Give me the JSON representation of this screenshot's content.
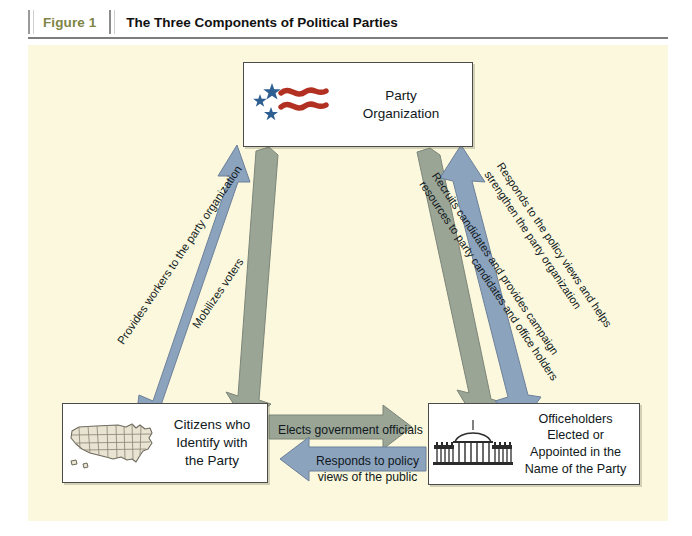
{
  "caption": {
    "figure_label": "Figure 1",
    "title": "The Three Components of Political Parties"
  },
  "colors": {
    "page_background": "#ffffff",
    "panel_background": "#fbf8dd",
    "arrow_blue": "#8ca3be",
    "arrow_gray_green": "#9aa596",
    "figure_label_color": "#7e8545",
    "flag_star_blue": "#2e5f92",
    "flag_stripe_red": "#b23022",
    "map_fill": "#e9e3d2",
    "whitehouse_dark": "#2b2b2b"
  },
  "nodes": [
    {
      "id": "party-organization",
      "label": "Party\nOrganization",
      "icon": "us-flag-stars-stripes-icon"
    },
    {
      "id": "citizens",
      "label": "Citizens who\nIdentify with\nthe Party",
      "icon": "united-states-map-icon"
    },
    {
      "id": "officeholders",
      "label": "Officeholders\nElected or\nAppointed in the\nName of the Party",
      "icon": "white-house-icon"
    }
  ],
  "arrows": [
    {
      "id": "provides-workers",
      "label": "Provides workers to the party organization",
      "color": "#8ca3be",
      "from": "citizens",
      "to": "party-organization",
      "direction": "up-right-to-up-left"
    },
    {
      "id": "mobilizes-voters",
      "label": "Mobilizes voters",
      "color": "#9aa596",
      "from": "party-organization",
      "to": "citizens",
      "direction": "down-left"
    },
    {
      "id": "recruits-candidates",
      "label": "Recruits candidates and provides campaign\nresources to party candidates and office holders",
      "color": "#9aa596",
      "from": "party-organization",
      "to": "officeholders",
      "direction": "down-right"
    },
    {
      "id": "responds-policy-views",
      "label": "Responds to the policy views and helps\nstrengthen the party organization",
      "color": "#8ca3be",
      "from": "officeholders",
      "to": "party-organization",
      "direction": "up-left"
    },
    {
      "id": "elects-government-officials",
      "label": "Elects government officials",
      "color": "#9aa596",
      "from": "citizens",
      "to": "officeholders",
      "direction": "right"
    },
    {
      "id": "responds-to-public",
      "label": "Responds to policy\nviews of the public",
      "color": "#8ca3be",
      "from": "officeholders",
      "to": "citizens",
      "direction": "left"
    }
  ],
  "arrow_labels": {
    "provides_workers": "Provides workers to the party organization",
    "mobilizes_voters": "Mobilizes voters",
    "recruits_line1": "Recruits candidates and provides campaign",
    "recruits_line2": "resources to party candidates and office holders",
    "responds_policy_line1": "Responds to the policy views and helps",
    "responds_policy_line2": "strengthen the party organization",
    "elects": "Elects government officials",
    "responds_public_line1": "Responds to policy",
    "responds_public_line2": "views of the public"
  },
  "node_text": {
    "party_line1": "Party",
    "party_line2": "Organization",
    "citizens_line1": "Citizens who",
    "citizens_line2": "Identify with",
    "citizens_line3": "the Party",
    "office_line1": "Officeholders",
    "office_line2": "Elected or",
    "office_line3": "Appointed in the",
    "office_line4": "Name of the Party"
  }
}
